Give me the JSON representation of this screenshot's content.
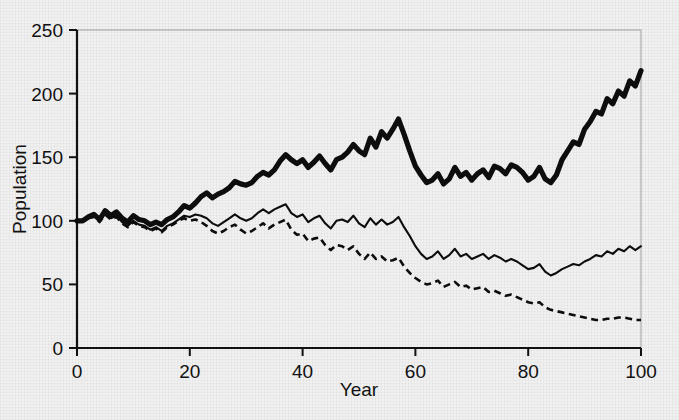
{
  "chart_data": {
    "type": "line",
    "title": "",
    "xlabel": "Year",
    "ylabel": "Population",
    "xlim": [
      0,
      100
    ],
    "ylim": [
      0,
      250
    ],
    "xticks": [
      0,
      20,
      40,
      60,
      80,
      100
    ],
    "yticks": [
      0,
      50,
      100,
      150,
      200,
      250
    ],
    "xtick_labels": [
      "0",
      "20",
      "40",
      "60",
      "80",
      "100"
    ],
    "ytick_labels": [
      "0",
      "50",
      "100",
      "150",
      "200",
      "250"
    ],
    "grid": false,
    "legend": "none",
    "x": [
      0,
      1,
      2,
      3,
      4,
      5,
      6,
      7,
      8,
      9,
      10,
      11,
      12,
      13,
      14,
      15,
      16,
      17,
      18,
      19,
      20,
      21,
      22,
      23,
      24,
      25,
      26,
      27,
      28,
      29,
      30,
      31,
      32,
      33,
      34,
      35,
      36,
      37,
      38,
      39,
      40,
      41,
      42,
      43,
      44,
      45,
      46,
      47,
      48,
      49,
      50,
      51,
      52,
      53,
      54,
      55,
      56,
      57,
      58,
      59,
      60,
      61,
      62,
      63,
      64,
      65,
      66,
      67,
      68,
      69,
      70,
      71,
      72,
      73,
      74,
      75,
      76,
      77,
      78,
      79,
      80,
      81,
      82,
      83,
      84,
      85,
      86,
      87,
      88,
      89,
      90,
      91,
      92,
      93,
      94,
      95,
      96,
      97,
      98,
      99,
      100
    ],
    "series": [
      {
        "name": "bold-line",
        "style": "solid-thick",
        "color": "#0d0d0d",
        "values": [
          100,
          100,
          103,
          105,
          101,
          108,
          104,
          107,
          102,
          99,
          104,
          101,
          100,
          97,
          99,
          97,
          101,
          103,
          107,
          112,
          110,
          114,
          119,
          122,
          118,
          121,
          123,
          126,
          131,
          129,
          128,
          130,
          135,
          138,
          136,
          140,
          147,
          152,
          148,
          145,
          148,
          142,
          146,
          151,
          145,
          140,
          148,
          150,
          154,
          160,
          155,
          152,
          165,
          158,
          170,
          165,
          172,
          180,
          168,
          155,
          143,
          136,
          130,
          132,
          137,
          129,
          133,
          142,
          135,
          138,
          132,
          137,
          140,
          134,
          143,
          141,
          137,
          144,
          142,
          138,
          132,
          135,
          142,
          133,
          130,
          136,
          148,
          155,
          162,
          160,
          172,
          178,
          186,
          184,
          196,
          192,
          202,
          198,
          210,
          206,
          218
        ]
      },
      {
        "name": "thin-line",
        "style": "solid-thin",
        "color": "#0d0d0d",
        "values": [
          100,
          100,
          102,
          104,
          100,
          106,
          102,
          104,
          99,
          96,
          100,
          97,
          96,
          93,
          95,
          92,
          96,
          98,
          101,
          104,
          103,
          105,
          104,
          102,
          98,
          96,
          99,
          102,
          105,
          102,
          100,
          102,
          106,
          109,
          106,
          109,
          111,
          113,
          106,
          103,
          105,
          99,
          102,
          104,
          98,
          94,
          100,
          101,
          99,
          104,
          98,
          95,
          102,
          97,
          101,
          97,
          99,
          103,
          95,
          88,
          80,
          74,
          70,
          72,
          76,
          70,
          73,
          78,
          72,
          74,
          70,
          72,
          74,
          70,
          73,
          71,
          68,
          70,
          68,
          65,
          62,
          63,
          66,
          60,
          57,
          59,
          62,
          64,
          66,
          65,
          68,
          70,
          73,
          72,
          76,
          74,
          78,
          76,
          80,
          77,
          80
        ]
      },
      {
        "name": "dashed-line",
        "style": "dashed",
        "color": "#0d0d0d",
        "values": [
          100,
          100,
          102,
          103,
          99,
          105,
          101,
          103,
          98,
          95,
          99,
          96,
          95,
          92,
          94,
          91,
          95,
          97,
          100,
          102,
          100,
          101,
          99,
          96,
          92,
          90,
          92,
          95,
          97,
          93,
          90,
          92,
          95,
          98,
          94,
          97,
          99,
          101,
          93,
          89,
          90,
          84,
          86,
          87,
          81,
          77,
          81,
          80,
          77,
          80,
          74,
          70,
          75,
          70,
          72,
          68,
          69,
          71,
          64,
          59,
          55,
          52,
          50,
          51,
          53,
          48,
          50,
          52,
          48,
          49,
          46,
          47,
          48,
          44,
          45,
          43,
          41,
          42,
          40,
          38,
          36,
          35,
          36,
          32,
          30,
          29,
          28,
          27,
          26,
          25,
          24,
          23,
          22,
          22,
          23,
          23,
          24,
          24,
          23,
          22,
          22
        ]
      }
    ]
  },
  "axes": {
    "ylabel": "Population",
    "xlabel": "Year"
  }
}
